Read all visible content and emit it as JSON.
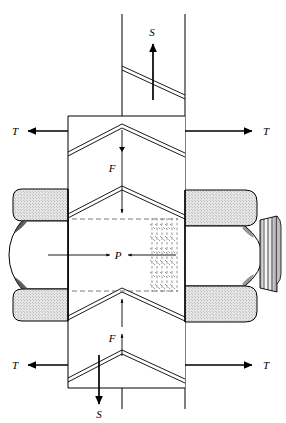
{
  "figure": {
    "colors": {
      "line": "#000000",
      "nut_shade": "#d8d8d8",
      "hidden_line": "#555555",
      "background": "#ffffff"
    },
    "labels": [
      {
        "id": "s-top",
        "text": "S",
        "x": 152,
        "y": 36,
        "arrow": "up",
        "name": "shear-load-top"
      },
      {
        "id": "t-top-left",
        "text": "T",
        "x": 15,
        "y": 132,
        "arrow": "left",
        "name": "tensile-load-top-left"
      },
      {
        "id": "t-top-right",
        "text": "T",
        "x": 266,
        "y": 132,
        "arrow": "right",
        "name": "tensile-load-top-right"
      },
      {
        "id": "f-upper",
        "text": "F",
        "x": 112,
        "y": 169,
        "arrow": "down",
        "name": "clamp-load-upper"
      },
      {
        "id": "p-center",
        "text": "P",
        "x": 117,
        "y": 260,
        "arrow": "converging",
        "name": "bearing-pressure"
      },
      {
        "id": "f-lower",
        "text": "F",
        "x": 112,
        "y": 339,
        "arrow": "up",
        "name": "clamp-load-lower"
      },
      {
        "id": "t-bot-left",
        "text": "T",
        "x": 15,
        "y": 366,
        "arrow": "left",
        "name": "tensile-load-bottom-left"
      },
      {
        "id": "t-bot-right",
        "text": "T",
        "x": 266,
        "y": 366,
        "arrow": "right",
        "name": "tensile-load-bottom-right"
      },
      {
        "id": "s-bottom",
        "text": "S",
        "x": 112,
        "y": 414,
        "arrow": "down",
        "name": "shear-load-bottom"
      }
    ],
    "components": {
      "left_nut": "hex-nut-left",
      "right_nut": "hex-nut-right",
      "bolt_thread_end": "bolt-threaded-end",
      "hidden_threads": "hidden-thread-lines",
      "front_plate": "front-plate",
      "back_plate": "back-plate"
    }
  }
}
